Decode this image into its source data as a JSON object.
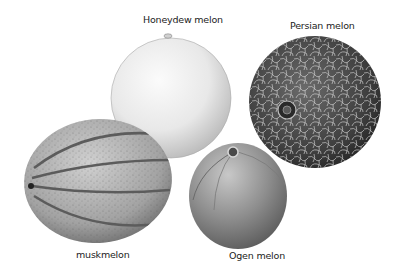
{
  "figure": {
    "background": "#ffffff",
    "melons": [
      {
        "id": "honeydew",
        "label": "Honeydew melon",
        "tone": "#e6e6e6"
      },
      {
        "id": "persian",
        "label": "Persian melon",
        "tone": "#4a4a4a"
      },
      {
        "id": "muskmelon",
        "label": "muskmelon",
        "tone": "#a9a9a9"
      },
      {
        "id": "ogen",
        "label": "Ogen melon",
        "tone": "#8a8a8a"
      }
    ]
  }
}
